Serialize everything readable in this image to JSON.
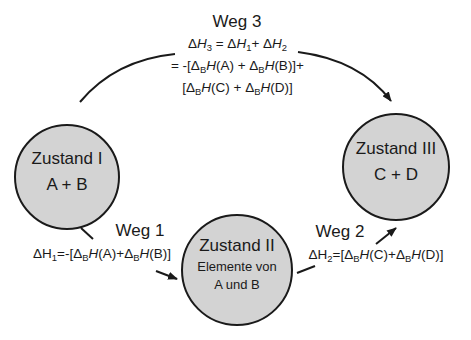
{
  "colors": {
    "circle_fill": "#d3d3d3",
    "stroke": "#1a1a1a",
    "background": "#ffffff"
  },
  "states": [
    {
      "id": "zustand-1",
      "title": "Zustand I",
      "content": "A + B"
    },
    {
      "id": "zustand-2",
      "title": "Zustand II",
      "content_lines": [
        "Elemente von",
        "A und B"
      ]
    },
    {
      "id": "zustand-3",
      "title": "Zustand III",
      "content": "C + D"
    }
  ],
  "paths": {
    "weg1": {
      "label": "Weg 1",
      "equation": {
        "lhs": "ΔH",
        "lhs_sub": "1",
        "rhs_parts": [
          "=-[Δ",
          "B",
          "H",
          "(A)+Δ",
          "B",
          "H",
          "(B)]"
        ]
      }
    },
    "weg2": {
      "label": "Weg 2",
      "equation": {
        "lhs": "ΔH",
        "lhs_sub": "2",
        "rhs_parts": [
          "=[Δ",
          "B",
          "H",
          "(C)+Δ",
          "B",
          "H",
          "(D)]"
        ]
      }
    },
    "weg3": {
      "label": "Weg 3",
      "line1": {
        "parts": [
          "Δ",
          "H",
          "3",
          " = Δ",
          "H",
          "1",
          "+ Δ",
          "H",
          "2"
        ]
      },
      "line2": {
        "parts": [
          "= -[Δ",
          "B",
          "H",
          "(A) + Δ",
          "B",
          "H",
          "(B)]+"
        ]
      },
      "line3": {
        "parts": [
          "[Δ",
          "B",
          "H",
          "(C) + Δ",
          "B",
          "H",
          "(D)]"
        ]
      }
    }
  }
}
